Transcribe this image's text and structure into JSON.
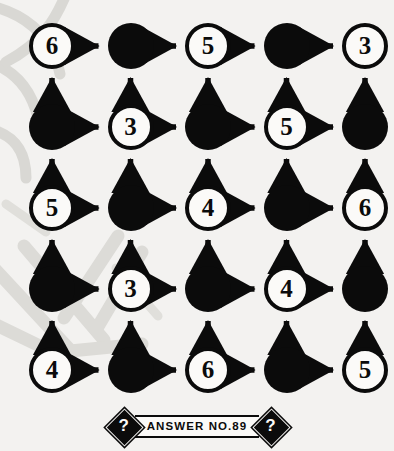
{
  "puzzle": {
    "type": "arrow-grid-number-puzzle",
    "grid": {
      "rows": 5,
      "cols": 5,
      "cells": [
        [
          {
            "state": "open",
            "value": "6"
          },
          {
            "state": "filled",
            "value": ""
          },
          {
            "state": "open",
            "value": "5"
          },
          {
            "state": "filled",
            "value": ""
          },
          {
            "state": "open",
            "value": "3"
          }
        ],
        [
          {
            "state": "filled",
            "value": ""
          },
          {
            "state": "open",
            "value": "3"
          },
          {
            "state": "filled",
            "value": ""
          },
          {
            "state": "open",
            "value": "5"
          },
          {
            "state": "filled",
            "value": ""
          }
        ],
        [
          {
            "state": "open",
            "value": "5"
          },
          {
            "state": "filled",
            "value": ""
          },
          {
            "state": "open",
            "value": "4"
          },
          {
            "state": "filled",
            "value": ""
          },
          {
            "state": "open",
            "value": "6"
          }
        ],
        [
          {
            "state": "filled",
            "value": ""
          },
          {
            "state": "open",
            "value": "3"
          },
          {
            "state": "filled",
            "value": ""
          },
          {
            "state": "open",
            "value": "4"
          },
          {
            "state": "filled",
            "value": ""
          }
        ],
        [
          {
            "state": "open",
            "value": "4"
          },
          {
            "state": "filled",
            "value": ""
          },
          {
            "state": "open",
            "value": "6"
          },
          {
            "state": "filled",
            "value": ""
          },
          {
            "state": "open",
            "value": "5"
          }
        ]
      ],
      "arrows": {
        "horizontal_direction": "right",
        "vertical_direction": "up"
      }
    },
    "colors": {
      "ink": "#0b0b0b",
      "paper": "#f3f2f0",
      "node_fill_open": "#fbfaf8",
      "watermark": "#d9d8d4"
    }
  },
  "footer": {
    "left_marker": "?",
    "right_marker": "?",
    "label": "ANSWER NO.89"
  }
}
